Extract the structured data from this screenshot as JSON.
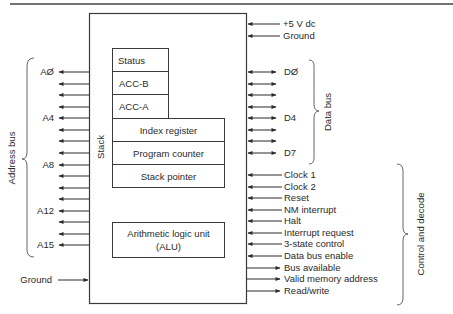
{
  "diagram": {
    "type": "block-diagram",
    "power": [
      {
        "label": "+5 V dc",
        "direction": "in"
      },
      {
        "label": "Ground",
        "direction": "in"
      }
    ],
    "registers": {
      "status": "Status",
      "acc_b": "ACC-B",
      "acc_a": "ACC-A",
      "index": "Index register",
      "pc": "Program counter",
      "sp": "Stack pointer",
      "alu_line1": "Arithmetic logic unit",
      "alu_line2": "(ALU)"
    },
    "stack_label": "Stack",
    "address_bus": {
      "group_label": "Address bus",
      "lines": 16,
      "labels": [
        "AØ",
        "A4",
        "A8",
        "A12",
        "A15"
      ],
      "direction": "out"
    },
    "left_ground": "Ground",
    "data_bus": {
      "group_label": "Data bus",
      "lines": 8,
      "labels": [
        "DØ",
        "D4",
        "D7"
      ],
      "direction": "bidirectional"
    },
    "control": {
      "group_label": "Control and decode",
      "signals": [
        {
          "label": "Clock 1",
          "direction": "in"
        },
        {
          "label": "Clock 2",
          "direction": "in"
        },
        {
          "label": "Reset",
          "direction": "in"
        },
        {
          "label": "NM interrupt",
          "direction": "in"
        },
        {
          "label": "Halt",
          "direction": "in"
        },
        {
          "label": "Interrupt request",
          "direction": "in"
        },
        {
          "label": "3-state control",
          "direction": "in"
        },
        {
          "label": "Data bus enable",
          "direction": "in"
        },
        {
          "label": "Bus available",
          "direction": "out"
        },
        {
          "label": "Valid memory address",
          "direction": "out"
        },
        {
          "label": "Read/write",
          "direction": "out"
        }
      ]
    }
  },
  "colors": {
    "line": "#3a3a3a",
    "text": "#2a2a2a",
    "background": "#ffffff"
  }
}
